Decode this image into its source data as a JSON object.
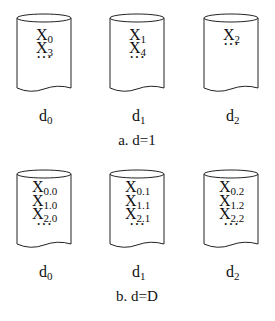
{
  "panels": [
    {
      "caption": "a. d=1",
      "disks": [
        {
          "label": "d",
          "label_sub": "0",
          "items": [
            {
              "base": "X",
              "sub": "0"
            },
            {
              "base": "X",
              "sub": "3"
            },
            {
              "base": "···",
              "sub": ""
            }
          ]
        },
        {
          "label": "d",
          "label_sub": "1",
          "items": [
            {
              "base": "X",
              "sub": "1"
            },
            {
              "base": "X",
              "sub": "4"
            },
            {
              "base": "···",
              "sub": ""
            }
          ]
        },
        {
          "label": "d",
          "label_sub": "2",
          "items": [
            {
              "base": "X",
              "sub": "2"
            },
            {
              "base": "···",
              "sub": ""
            }
          ]
        }
      ]
    },
    {
      "caption": "b. d=D",
      "disks": [
        {
          "label": "d",
          "label_sub": "0",
          "items": [
            {
              "base": "X",
              "sub": "0.0"
            },
            {
              "base": "X",
              "sub": "1.0"
            },
            {
              "base": "X",
              "sub": "2.0"
            },
            {
              "base": "···",
              "sub": ""
            }
          ]
        },
        {
          "label": "d",
          "label_sub": "1",
          "items": [
            {
              "base": "X",
              "sub": "0.1"
            },
            {
              "base": "X",
              "sub": "1.1"
            },
            {
              "base": "X",
              "sub": "2.1"
            },
            {
              "base": "···",
              "sub": ""
            }
          ]
        },
        {
          "label": "d",
          "label_sub": "2",
          "items": [
            {
              "base": "X",
              "sub": "0.2"
            },
            {
              "base": "X",
              "sub": "1.2"
            },
            {
              "base": "X",
              "sub": "2.2"
            },
            {
              "base": "···",
              "sub": ""
            }
          ]
        }
      ]
    }
  ]
}
